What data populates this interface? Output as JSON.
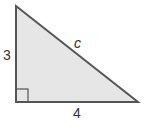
{
  "diagram": {
    "type": "right-triangle",
    "fill": "#e6e6e6",
    "stroke": "#555555",
    "vertices": {
      "top": [
        16,
        6
      ],
      "right_angle": [
        16,
        102
      ],
      "right": [
        138,
        102
      ]
    },
    "labels": {
      "vertical_leg": "3",
      "horizontal_leg": "4",
      "hypotenuse": "c"
    }
  }
}
